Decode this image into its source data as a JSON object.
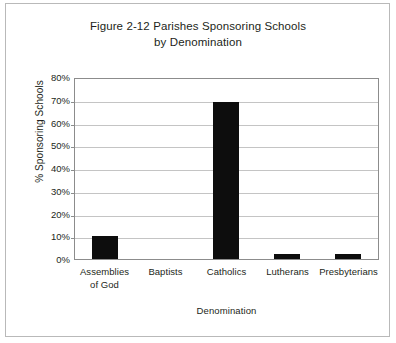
{
  "figure": {
    "title_lines": [
      "Figure 2-12 Parishes Sponsoring Schools",
      "by Denomination"
    ],
    "border_color": "#b9b9b9"
  },
  "chart_data": {
    "type": "bar",
    "title": "Figure 2-12 Parishes Sponsoring Schools by Denomination",
    "xlabel": "Denomination",
    "ylabel": "% Sponsoring Schools",
    "categories": [
      "Assemblies of God",
      "Baptists",
      "Catholics",
      "Lutherans",
      "Presbyterians"
    ],
    "category_label_lines": [
      [
        "Assemblies",
        "of God"
      ],
      [
        "Baptists"
      ],
      [
        "Catholics"
      ],
      [
        "Lutherans"
      ],
      [
        "Presbyterians"
      ]
    ],
    "values": [
      10,
      0,
      69,
      2,
      2
    ],
    "value_labels": [
      "10%",
      "0%",
      "69%",
      "2%",
      "2%"
    ],
    "ylim": [
      0,
      80
    ],
    "ytick_values": [
      80,
      70,
      60,
      50,
      40,
      30,
      20,
      10,
      0
    ],
    "ytick_labels": [
      "80%",
      "70%",
      "60%",
      "50%",
      "40%",
      "30%",
      "20%",
      "10%",
      "0%"
    ],
    "grid": true,
    "grid_color": "#c4c4c4",
    "legend": null,
    "bar_color": "#0d0d0d",
    "axis_color": "#8c8c8c",
    "text_color": "#231f20"
  }
}
